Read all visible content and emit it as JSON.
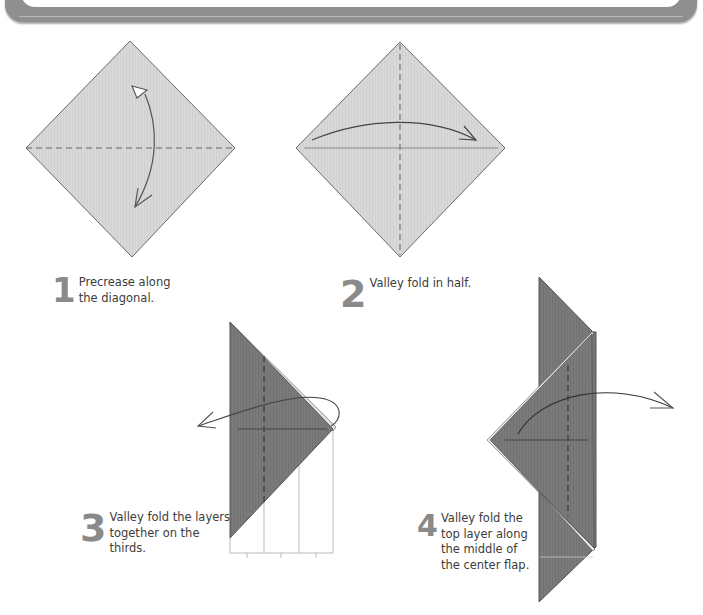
{
  "colors": {
    "paper_light": "#d6d6d6",
    "paper_dark": "#777777",
    "line": "#555555",
    "step_number": "#8a8a8a",
    "banner": "#8f8f8f"
  },
  "steps": [
    {
      "number": "1",
      "text_lines": [
        "Precrease along",
        "the diagonal."
      ]
    },
    {
      "number": "2",
      "text_lines": [
        "Valley fold in half."
      ]
    },
    {
      "number": "3",
      "text_lines": [
        "Valley fold the layers",
        "together on the",
        "thirds."
      ]
    },
    {
      "number": "4",
      "text_lines": [
        "Valley fold the",
        "top layer along",
        "the middle of",
        "the center flap."
      ]
    }
  ],
  "icons": {
    "step1_arrow": "curved-double-arrow-icon",
    "step2_arrow": "curved-arrow-right-icon",
    "step3_arrow": "curved-arrow-left-icon",
    "step4_arrow": "curved-arrow-right-icon"
  }
}
